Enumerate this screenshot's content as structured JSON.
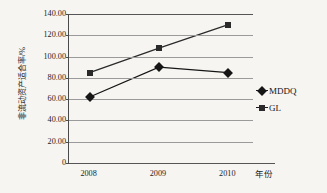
{
  "chart_data": {
    "type": "line",
    "title": "",
    "xlabel": "年份",
    "ylabel": "非流动资产适合率/%",
    "categories": [
      "2008",
      "2009",
      "2010"
    ],
    "ylim": [
      0,
      140
    ],
    "ytick_labels": [
      "140.00",
      "120.00",
      "100.00",
      "80.00",
      "60.00",
      "40.00",
      "20.00",
      "0"
    ],
    "ytick_values": [
      140,
      120,
      100,
      80,
      60,
      40,
      20,
      0
    ],
    "grid": true,
    "legend_position": "right",
    "series": [
      {
        "name": "MDDQ",
        "marker": "diamond",
        "color": "#151515",
        "values": [
          62,
          90,
          85
        ]
      },
      {
        "name": "GL",
        "marker": "square",
        "color": "#2a2a2a",
        "values": [
          85,
          108,
          130
        ]
      }
    ]
  },
  "legend": {
    "items": [
      {
        "label": "MDDQ",
        "marker": "diamond-marker"
      },
      {
        "label": "GL",
        "marker": "square-marker"
      }
    ]
  }
}
